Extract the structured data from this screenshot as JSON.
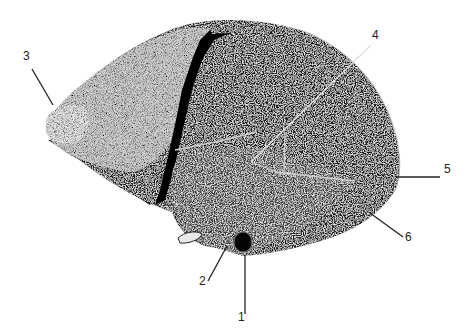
{
  "figure": {
    "background": "#ffffff",
    "ink": "#111111",
    "highlight": "#d8d8d8",
    "labels": [
      {
        "id": "1",
        "text": "1",
        "x": 238,
        "y": 321,
        "line": [
          [
            245,
            255
          ],
          [
            245,
            314
          ]
        ]
      },
      {
        "id": "2",
        "text": "2",
        "x": 199,
        "y": 285,
        "line": [
          [
            227,
            246
          ],
          [
            208,
            281
          ]
        ]
      },
      {
        "id": "3",
        "text": "3",
        "x": 23,
        "y": 60,
        "line": [
          [
            32,
            69
          ],
          [
            53,
            105
          ]
        ]
      },
      {
        "id": "4",
        "text": "4",
        "x": 372,
        "y": 39,
        "line": [
          [
            371,
            45
          ],
          [
            251,
            162
          ]
        ]
      },
      {
        "id": "5",
        "text": "5",
        "x": 444,
        "y": 173,
        "line": [
          [
            397,
            177
          ],
          [
            440,
            177
          ]
        ]
      },
      {
        "id": "6",
        "text": "6",
        "x": 405,
        "y": 241,
        "line": [
          [
            370,
            213
          ],
          [
            403,
            237
          ]
        ]
      }
    ],
    "sutures": [
      [
        [
          175,
          150
        ],
        [
          220,
          141
        ],
        [
          257,
          132
        ]
      ],
      [
        [
          251,
          162
        ],
        [
          282,
          174
        ]
      ],
      [
        [
          285,
          132
        ],
        [
          284,
          175
        ]
      ],
      [
        [
          275,
          172
        ],
        [
          355,
          181
        ]
      ]
    ]
  }
}
